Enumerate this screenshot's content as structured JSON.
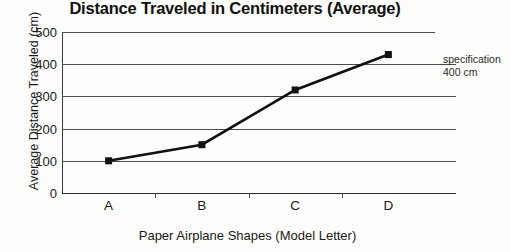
{
  "chart_data": {
    "type": "line",
    "title": "Distance Traveled in Centimeters (Average)",
    "xlabel": "Paper Airplane Shapes (Model Letter)",
    "ylabel": "Average Distance Traveled (cm)",
    "categories": [
      "A",
      "B",
      "C",
      "D"
    ],
    "values": [
      100,
      150,
      320,
      430
    ],
    "series": [
      {
        "name": "Average Distance Traveled",
        "values": [
          100,
          150,
          320,
          430
        ]
      }
    ],
    "ylim": [
      0,
      500
    ],
    "ytick_labels": [
      "0",
      "100",
      "200",
      "300",
      "400",
      "500"
    ],
    "ytick_values": [
      0,
      100,
      200,
      300,
      400,
      500
    ],
    "grid": true,
    "legend": "none",
    "marker": "square",
    "line_color": "#111111",
    "marker_color": "#111111",
    "annotations": [
      {
        "name": "specification-400",
        "line1": "specification",
        "line2": "400 cm",
        "value": 400
      }
    ]
  }
}
